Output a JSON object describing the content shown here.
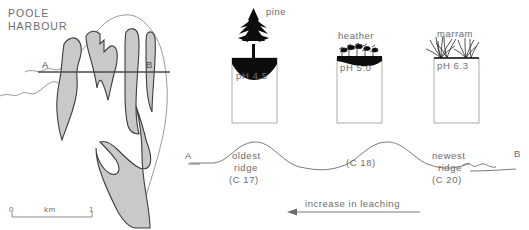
{
  "map": {
    "title_line1": "POOLE",
    "title_line2": "HARBOUR",
    "transect_start": "A",
    "transect_end": "B",
    "scale": {
      "min": "0",
      "unit": "km",
      "max": "1"
    },
    "colors": {
      "land_fill": "#c9c9c9",
      "outline": "#3d3d3d",
      "coast_line": "#8d8d8d",
      "transect_line": "#4a4a4a"
    }
  },
  "profile": {
    "start_label": "A",
    "end_label": "B",
    "ridges": [
      {
        "name_line1": "oldest",
        "name_line2": "ridge",
        "century": "(C 17)"
      },
      {
        "name_line1": "",
        "name_line2": "",
        "century": "(C 18)"
      },
      {
        "name_line1": "newest",
        "name_line2": "ridge",
        "century": "(C 20)"
      }
    ],
    "line_color": "#7a7a7a"
  },
  "soil_columns": [
    {
      "plant": "pine",
      "ph_label": "pH 4.5",
      "ph_value": 4.5,
      "vegetation_icon": "pine-tree-icon",
      "humus_thickness": "thick"
    },
    {
      "plant": "heather",
      "ph_label": "pH 5.0",
      "ph_value": 5.0,
      "vegetation_icon": "heather-shrub-icon",
      "humus_thickness": "medium"
    },
    {
      "plant": "marram",
      "ph_label": "pH 6.3",
      "ph_value": 6.3,
      "vegetation_icon": "marram-grass-icon",
      "humus_thickness": "thin"
    }
  ],
  "leaching_arrow": {
    "caption": "increase in leaching",
    "direction": "left",
    "color": "#7a7a7a"
  }
}
